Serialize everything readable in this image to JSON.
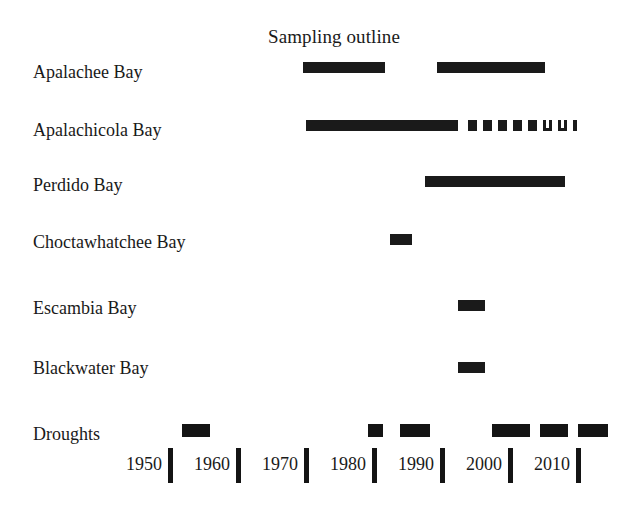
{
  "figure": {
    "title": "Sampling outline",
    "background": "#ffffff",
    "bar_color": "#1a1a1a",
    "width": 644,
    "height": 510
  },
  "axis": {
    "ticks": [
      {
        "label": "1950",
        "year": 1950
      },
      {
        "label": "1960",
        "year": 1960
      },
      {
        "label": "1970",
        "year": 1970
      },
      {
        "label": "1980",
        "year": 1980
      },
      {
        "label": "1990",
        "year": 1990
      },
      {
        "label": "2000",
        "year": 2000
      },
      {
        "label": "2010",
        "year": 2010
      }
    ],
    "pixels_per_decade": 68,
    "x_origin_px": 168,
    "origin_year": 1950
  },
  "rows": [
    {
      "label": "Apalachee Bay",
      "y": 62
    },
    {
      "label": "Apalachicola Bay",
      "y": 120
    },
    {
      "label": "Perdido Bay",
      "y": 175
    },
    {
      "label": "Choctawhatchee Bay",
      "y": 232
    },
    {
      "label": "Escambia Bay",
      "y": 298
    },
    {
      "label": "Blackwater Bay",
      "y": 358
    },
    {
      "label": "Droughts",
      "y": 424
    }
  ],
  "chart_data": {
    "type": "bar",
    "subtype": "timeline-gantt",
    "title": "Sampling outline",
    "xlabel": "",
    "ylabel": "",
    "xlim": [
      1947,
      2018
    ],
    "grid": false,
    "legend": "none",
    "categories": [
      "Apalachee Bay",
      "Apalachicola Bay",
      "Perdido Bay",
      "Choctawhatchee Bay",
      "Escambia Bay",
      "Blackwater Bay",
      "Droughts"
    ],
    "series": [
      {
        "name": "Apalachee Bay",
        "intervals": [
          {
            "start": 1969.9,
            "end": 1981.9,
            "style": "solid"
          },
          {
            "start": 1989.6,
            "end": 2005.4,
            "style": "solid"
          }
        ]
      },
      {
        "name": "Apalachicola Bay",
        "intervals": [
          {
            "start": 1970.3,
            "end": 1992.6,
            "style": "solid"
          },
          {
            "start": 1994.1,
            "end": 1995.4,
            "style": "dashed"
          },
          {
            "start": 1996.3,
            "end": 1997.6,
            "style": "dashed"
          },
          {
            "start": 1998.5,
            "end": 1999.9,
            "style": "dashed"
          },
          {
            "start": 2000.7,
            "end": 2002.1,
            "style": "dashed"
          },
          {
            "start": 2003.0,
            "end": 2004.3,
            "style": "dashed"
          },
          {
            "start": 2005.1,
            "end": 2006.5,
            "style": "dashed-open"
          },
          {
            "start": 2007.4,
            "end": 2008.7,
            "style": "dashed-open"
          },
          {
            "start": 2009.6,
            "end": 2010.1,
            "style": "dashed"
          }
        ]
      },
      {
        "name": "Perdido Bay",
        "intervals": [
          {
            "start": 1987.8,
            "end": 2008.4,
            "style": "solid"
          }
        ]
      },
      {
        "name": "Choctawhatchee Bay",
        "intervals": [
          {
            "start": 1982.6,
            "end": 1985.9,
            "style": "solid"
          }
        ]
      },
      {
        "name": "Escambia Bay",
        "intervals": [
          {
            "start": 1992.6,
            "end": 1996.6,
            "style": "solid"
          }
        ]
      },
      {
        "name": "Blackwater Bay",
        "intervals": [
          {
            "start": 1992.6,
            "end": 1996.6,
            "style": "solid"
          }
        ]
      },
      {
        "name": "Droughts",
        "intervals": [
          {
            "start": 1952.1,
            "end": 1956.2,
            "style": "solid"
          },
          {
            "start": 1979.4,
            "end": 1981.6,
            "style": "solid"
          },
          {
            "start": 1984.1,
            "end": 1988.5,
            "style": "solid"
          },
          {
            "start": 1997.6,
            "end": 2003.2,
            "style": "solid"
          },
          {
            "start": 2004.7,
            "end": 2008.8,
            "style": "solid"
          },
          {
            "start": 2010.3,
            "end": 2014.7,
            "style": "solid"
          }
        ]
      }
    ]
  }
}
